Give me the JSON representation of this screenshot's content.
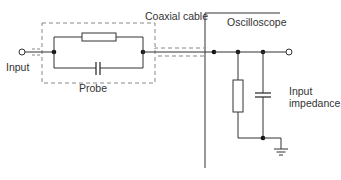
{
  "diagram": {
    "labels": {
      "input": "Input",
      "probe": "Probe",
      "coaxial_cable": "Coaxial cable",
      "oscilloscope": "Oscilloscope",
      "input_impedance_line1": "Input",
      "input_impedance_line2": "impedance"
    },
    "components": [
      {
        "id": "input-terminal",
        "type": "terminal-open"
      },
      {
        "id": "probe-resistor",
        "type": "resistor",
        "group": "Probe"
      },
      {
        "id": "probe-capacitor",
        "type": "capacitor",
        "group": "Probe"
      },
      {
        "id": "coax-shield",
        "type": "dashed-shield",
        "group": "Coaxial cable"
      },
      {
        "id": "scope-resistor",
        "type": "resistor",
        "group": "Oscilloscope"
      },
      {
        "id": "scope-capacitor",
        "type": "capacitor",
        "group": "Oscilloscope"
      },
      {
        "id": "ground",
        "type": "ground"
      },
      {
        "id": "output-terminal",
        "type": "terminal-open"
      }
    ],
    "colors": {
      "line": "#333333",
      "dashed": "#777777",
      "background": "#ffffff"
    }
  }
}
